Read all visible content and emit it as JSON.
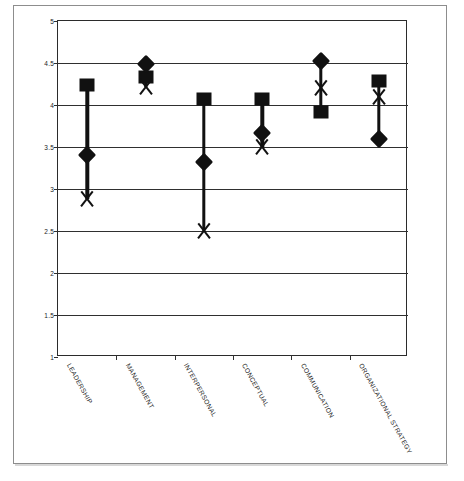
{
  "page": {
    "background_color": "#ffffff",
    "frame_color": "#8d8d8d"
  },
  "chart_data": {
    "type": "line",
    "title": "",
    "subtitle": "",
    "xlabel": "",
    "ylabel": "",
    "ylim": [
      1,
      5
    ],
    "ytick_labels": [
      "5",
      "4.5",
      "4",
      "3.5",
      "3",
      "2.5",
      "2",
      "1.5",
      "1"
    ],
    "ytick_values": [
      5,
      4.5,
      4,
      3.5,
      3,
      2.5,
      2,
      1.5,
      1
    ],
    "grid": true,
    "grid_axis": "y",
    "legend": false,
    "legend_position": "none",
    "marker_color": "#111111",
    "categories": [
      "LEADERSHIP",
      "MANAGEMENT",
      "INTERPERSONAL",
      "CONCEPTUAL",
      "COMMUNICATION",
      "ORGANIZATIONAL STRATEGY"
    ],
    "series": [
      {
        "name": "square",
        "marker": "square",
        "values": [
          4.24,
          4.33,
          4.07,
          4.07,
          3.92,
          4.28
        ]
      },
      {
        "name": "diamond",
        "marker": "diamond",
        "values": [
          3.41,
          4.49,
          3.32,
          3.67,
          4.52,
          3.6
        ]
      },
      {
        "name": "x",
        "marker": "x",
        "values": [
          2.88,
          4.21,
          2.5,
          3.5,
          4.2,
          4.1
        ]
      }
    ]
  }
}
